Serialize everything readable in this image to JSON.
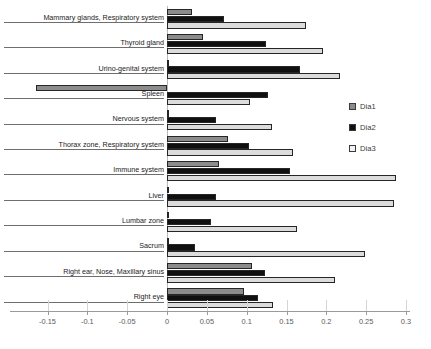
{
  "chart_data": {
    "type": "bar",
    "orientation": "horizontal",
    "title": "",
    "subtitle": "",
    "xlabel": "",
    "ylabel": "",
    "xlim": [
      -0.175,
      0.305
    ],
    "xticks": [
      -0.15,
      -0.1,
      -0.05,
      0,
      0.05,
      0.1,
      0.15,
      0.2,
      0.25,
      0.3
    ],
    "xticklabels": [
      "-0.15",
      "-0.1",
      "-0.05",
      "0",
      "0.05",
      "0.1",
      "0.15",
      "0.2",
      "0.25",
      "0.3"
    ],
    "grid": false,
    "legend_position": "right",
    "categories": [
      "Mammary glands, Respiratory system",
      "Thyroid gland",
      "Urino-genital system",
      "Spleen",
      "Nervous system",
      "Thorax zone, Respiratory system",
      "Immune system",
      "Liver",
      "Lumbar zone",
      "Sacrum",
      "Right ear, Nose, Maxillary sinus",
      "Right eye"
    ],
    "series": [
      {
        "name": "Dia1",
        "color": "#8c8c8c",
        "values": [
          0.031,
          0.045,
          0.002,
          -0.164,
          0.0,
          0.076,
          0.065,
          0.002,
          0.003,
          0.003,
          0.107,
          0.097
        ]
      },
      {
        "name": "Dia2",
        "color": "#101010",
        "values": [
          0.071,
          0.124,
          0.167,
          0.127,
          0.062,
          0.103,
          0.154,
          0.062,
          0.055,
          0.035,
          0.123,
          0.114
        ]
      },
      {
        "name": "Dia3",
        "color": "#dcdcdc",
        "values": [
          0.175,
          0.196,
          0.217,
          0.104,
          0.132,
          0.158,
          0.288,
          0.285,
          0.163,
          0.248,
          0.211,
          0.133
        ]
      }
    ]
  },
  "legend": {
    "items": [
      {
        "label": "Dia1"
      },
      {
        "label": "Dia2"
      },
      {
        "label": "Dia3"
      }
    ]
  }
}
